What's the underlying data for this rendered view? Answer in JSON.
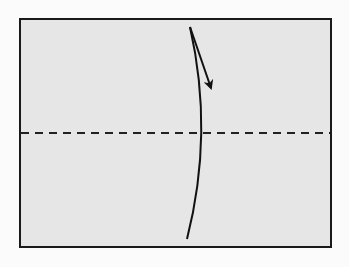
{
  "diagram": {
    "type": "origami-fold-step",
    "canvas": {
      "width": 349,
      "height": 267,
      "background": "#fbfbfb"
    },
    "paper": {
      "shape": "rectangle",
      "x": 20,
      "y": 19,
      "width": 311,
      "height": 228,
      "fill": "#e6e6e6",
      "stroke": "#1a1a1a",
      "stroke_width": 2
    },
    "valley_fold_line": {
      "style": "dashed",
      "orientation": "horizontal",
      "x1": 21,
      "y1": 133,
      "x2": 330,
      "y2": 133,
      "stroke": "#222222",
      "stroke_width": 2,
      "dash": "8,6"
    },
    "fold_curve": {
      "path": "M 190 27 Q 214 133 187 239",
      "stroke": "#111111",
      "stroke_width": 2
    },
    "fold_arrow": {
      "x1": 190,
      "y1": 27,
      "x2": 211,
      "y2": 88,
      "stroke": "#111111",
      "stroke_width": 2,
      "direction": "down"
    },
    "colors": {
      "background": "#fbfbfb",
      "paper": "#e6e6e6",
      "line": "#111111"
    }
  }
}
